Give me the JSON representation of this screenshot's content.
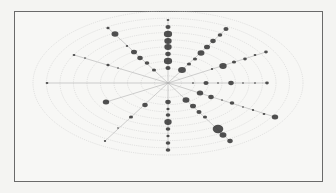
{
  "chart_data": {
    "type": "scatter",
    "subtype": "polar-bubble",
    "title": "",
    "xlabel": "",
    "ylabel": "",
    "grid": true,
    "legend": null,
    "center": [
      168,
      83
    ],
    "rings": {
      "count": 10,
      "max_rx": 135,
      "max_ry": 72,
      "color": "#c8c8c8"
    },
    "spokes": [
      {
        "angle_deg": 90,
        "points": [
          [
            168,
            20,
            1.2
          ],
          [
            168,
            27,
            2.2
          ],
          [
            168,
            34,
            3.6
          ],
          [
            168,
            41,
            3.2
          ],
          [
            168,
            47,
            3.2
          ],
          [
            168,
            54,
            2.4
          ],
          [
            168,
            61,
            3.6
          ],
          [
            168,
            68,
            2.2
          ]
        ]
      },
      {
        "angle_deg": -90,
        "points": [
          [
            168,
            102,
            2.4
          ],
          [
            168,
            109,
            1.4
          ],
          [
            168,
            115,
            2.0
          ],
          [
            168,
            122,
            3.2
          ],
          [
            168,
            129,
            2.0
          ],
          [
            168,
            136,
            1.4
          ],
          [
            168,
            143,
            2.0
          ],
          [
            168,
            150,
            2.0
          ]
        ]
      },
      {
        "angle_deg": 135,
        "points": [
          [
            108,
            28,
            1.4
          ],
          [
            115,
            34,
            3.0
          ],
          [
            127,
            46,
            1.0
          ],
          [
            134,
            52,
            2.6
          ],
          [
            140,
            58,
            2.4
          ],
          [
            147,
            63,
            2.0
          ],
          [
            154,
            70,
            1.8
          ]
        ]
      },
      {
        "angle_deg": 45,
        "points": [
          [
            226,
            29,
            2.2
          ],
          [
            220,
            35,
            2.0
          ],
          [
            213,
            41,
            2.4
          ],
          [
            207,
            47,
            2.6
          ],
          [
            201,
            53,
            3.0
          ],
          [
            195,
            59,
            1.8
          ],
          [
            189,
            64,
            1.8
          ],
          [
            182,
            70,
            3.4
          ]
        ]
      },
      {
        "angle_deg": 25,
        "points": [
          [
            266,
            52,
            1.6
          ],
          [
            255,
            55,
            1.2
          ],
          [
            245,
            59,
            1.6
          ],
          [
            234,
            62,
            1.8
          ],
          [
            223,
            66,
            3.2
          ],
          [
            212,
            69,
            1.0
          ]
        ]
      },
      {
        "angle_deg": 0,
        "points": [
          [
            193,
            83,
            0.9
          ],
          [
            206,
            83,
            2.2
          ],
          [
            218,
            83,
            0.8
          ],
          [
            231,
            83,
            2.4
          ],
          [
            243,
            83,
            0.8
          ],
          [
            255,
            83,
            0.9
          ],
          [
            267,
            83,
            1.6
          ]
        ]
      },
      {
        "angle_deg": -22,
        "points": [
          [
            200,
            93,
            2.8
          ],
          [
            211,
            97,
            2.4
          ],
          [
            222,
            100,
            0.8
          ],
          [
            232,
            103,
            2.0
          ],
          [
            243,
            107,
            0.9
          ],
          [
            253,
            110,
            1.0
          ],
          [
            264,
            114,
            1.2
          ],
          [
            275,
            117,
            2.8
          ]
        ]
      },
      {
        "angle_deg": -52,
        "points": [
          [
            186,
            100,
            3.0
          ],
          [
            193,
            106,
            2.6
          ],
          [
            199,
            112,
            2.2
          ],
          [
            205,
            117,
            1.8
          ],
          [
            218,
            129,
            4.6
          ],
          [
            223,
            135,
            3.0
          ],
          [
            230,
            141,
            2.4
          ]
        ]
      },
      {
        "angle_deg": -135,
        "points": [
          [
            145,
            105,
            2.4
          ],
          [
            131,
            117,
            1.8
          ],
          [
            118,
            128,
            0.8
          ],
          [
            105,
            141,
            1.0
          ]
        ]
      },
      {
        "angle_deg": 160,
        "points": [
          [
            74,
            55,
            1.2
          ],
          [
            85,
            58,
            0.9
          ],
          [
            108,
            65,
            1.4
          ],
          [
            118,
            68,
            0.8
          ]
        ]
      },
      {
        "angle_deg": 180,
        "points": [
          [
            47,
            83,
            1.2
          ]
        ]
      },
      {
        "angle_deg": -160,
        "points": [
          [
            106,
            102,
            2.8
          ]
        ]
      }
    ],
    "colors": {
      "bubble": "#333333",
      "ring": "#c8c8c8",
      "spoke": "#b0b0b0",
      "frame": "#6a6a6a",
      "background": "#f7f7f5"
    }
  }
}
